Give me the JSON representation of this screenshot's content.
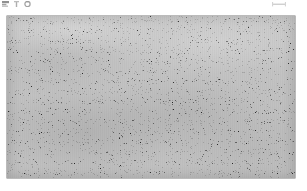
{
  "page": {
    "background_color": "#ffffff",
    "width": 307,
    "height": 191
  },
  "header": {
    "left_marks": [
      {
        "name": "glyph-mark-1",
        "color": "#5a5a5a"
      },
      {
        "name": "glyph-mark-2",
        "color": "#7a7a7a"
      },
      {
        "name": "glyph-mark-3",
        "color": "#6a6a6a"
      }
    ],
    "right_mark": {
      "name": "dash-mark",
      "color": "#9a9a9a"
    },
    "caption": ""
  },
  "image_panel": {
    "label": "",
    "border_color": "#787878",
    "base_color": "#727272",
    "description": "heavily noise-corrupted grayscale photograph",
    "noise": {
      "type": "salt-and-pepper",
      "coarse_frequency": 0.72,
      "fine_frequency": 0.95,
      "octaves": 3,
      "coarse_opacity": 0.95,
      "fine_opacity": 0.58
    },
    "geometry": {
      "left": 7,
      "top": 16,
      "width": 288,
      "height": 162
    }
  }
}
